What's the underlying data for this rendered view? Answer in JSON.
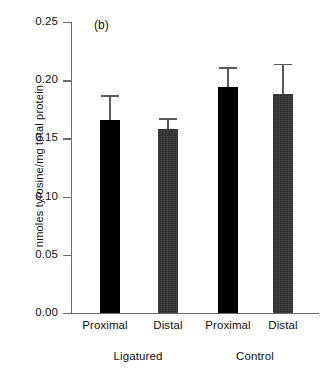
{
  "chart_data": {
    "type": "bar",
    "title": "",
    "panel_label": "(b)",
    "xlabel": "",
    "ylabel": "nmoles tyrosine/mg total protein",
    "ylim": [
      0.0,
      0.25
    ],
    "ytick_labels": [
      "0.25",
      "0.20",
      "0.15",
      "0.10",
      "0.05",
      "0.00"
    ],
    "ytick_values": [
      0.25,
      0.2,
      0.15,
      0.1,
      0.05,
      0.0
    ],
    "grid": false,
    "legend": "none",
    "categories": [
      "Proximal",
      "Distal",
      "Proximal",
      "Distal"
    ],
    "groups": [
      {
        "label": "Ligatured",
        "categories": [
          "Proximal",
          "Distal"
        ]
      },
      {
        "label": "Control",
        "categories": [
          "Proximal",
          "Distal"
        ]
      }
    ],
    "values": [
      0.166,
      0.158,
      0.194,
      0.188
    ],
    "errors_upper": [
      0.02,
      0.008,
      0.016,
      0.025
    ],
    "bars": [
      {
        "category": "Proximal",
        "group": "Ligatured",
        "value": 0.166,
        "error_upper": 0.02,
        "error_top": 0.186,
        "fill": "solid-black"
      },
      {
        "category": "Distal",
        "group": "Ligatured",
        "value": 0.158,
        "error_upper": 0.008,
        "error_top": 0.166,
        "fill": "textured-dark"
      },
      {
        "category": "Proximal",
        "group": "Control",
        "value": 0.194,
        "error_upper": 0.016,
        "error_top": 0.21,
        "fill": "solid-black"
      },
      {
        "category": "Distal",
        "group": "Control",
        "value": 0.188,
        "error_upper": 0.025,
        "error_top": 0.213,
        "fill": "textured-dark"
      }
    ],
    "colors": {
      "bar_solid": "#000000",
      "bar_textured": "#2c2c2c",
      "axis": "#6d6d6d",
      "error_bar": "#5a5a5a",
      "background": "#ffffff",
      "text": "#111111"
    }
  }
}
